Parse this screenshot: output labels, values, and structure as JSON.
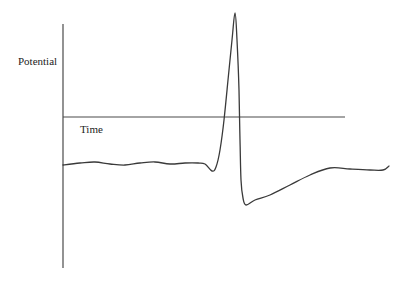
{
  "figure": {
    "y_axis_label": "Potential",
    "x_axis_label": "Time",
    "line_color": "#3a3a3a",
    "axis_color": "#4a4a4a",
    "background": "#ffffff"
  },
  "chart_data": {
    "type": "line",
    "title": "",
    "xlabel": "Time",
    "ylabel": "Potential",
    "grid": false,
    "legend": null,
    "axes": {
      "y_axis": {
        "x": 63,
        "y_top": 24,
        "y_bottom": 268
      },
      "x_axis_zero_line": {
        "y": 117,
        "x_start": 63,
        "x_end": 345
      }
    },
    "series": [
      {
        "name": "membrane potential",
        "points_px": [
          [
            63,
            165
          ],
          [
            80,
            163
          ],
          [
            95,
            162
          ],
          [
            110,
            164
          ],
          [
            125,
            165
          ],
          [
            140,
            163
          ],
          [
            155,
            162
          ],
          [
            170,
            164
          ],
          [
            185,
            163
          ],
          [
            198,
            163
          ],
          [
            205,
            164
          ],
          [
            212,
            171
          ],
          [
            216,
            167
          ],
          [
            220,
            150
          ],
          [
            224,
            120
          ],
          [
            228,
            80
          ],
          [
            232,
            40
          ],
          [
            235,
            13
          ],
          [
            237,
            40
          ],
          [
            239,
            90
          ],
          [
            240,
            140
          ],
          [
            241,
            180
          ],
          [
            243,
            198
          ],
          [
            246,
            205
          ],
          [
            255,
            200
          ],
          [
            270,
            195
          ],
          [
            290,
            185
          ],
          [
            310,
            175
          ],
          [
            330,
            168
          ],
          [
            350,
            169
          ],
          [
            370,
            170
          ],
          [
            383,
            170
          ],
          [
            389,
            166
          ]
        ]
      }
    ]
  }
}
